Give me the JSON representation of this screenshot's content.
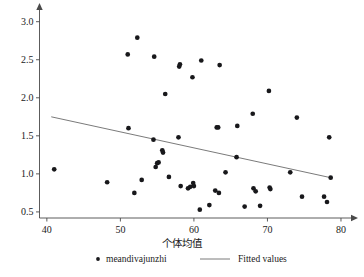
{
  "chart_data": {
    "type": "scatter",
    "title": "",
    "xlabel": "个体均值",
    "ylabel": "",
    "xlim": [
      39.0,
      81.5
    ],
    "ylim": [
      0.42,
      3.18
    ],
    "xticks": [
      40,
      50,
      60,
      70,
      80
    ],
    "xtick_labels": [
      "40",
      "50",
      "60",
      "70",
      "80"
    ],
    "yticks": [
      0.5,
      1.0,
      1.5,
      2.0,
      2.5,
      3.0
    ],
    "ytick_labels": [
      "0.5",
      "1.0",
      "1.5",
      "2.0",
      "2.5",
      "3.0"
    ],
    "grid": false,
    "legend_position": "below",
    "series": [
      {
        "name": "meandivajunzhi",
        "type": "scatter",
        "marker": "circle",
        "color": "#18181b",
        "points": [
          [
            41.0,
            1.06
          ],
          [
            48.2,
            0.89
          ],
          [
            51.0,
            2.57
          ],
          [
            51.1,
            1.6
          ],
          [
            51.9,
            0.75
          ],
          [
            52.3,
            2.79
          ],
          [
            52.9,
            0.92
          ],
          [
            54.6,
            2.54
          ],
          [
            54.5,
            1.45
          ],
          [
            54.8,
            1.09
          ],
          [
            55.0,
            1.14
          ],
          [
            55.2,
            1.15
          ],
          [
            55.7,
            1.31
          ],
          [
            55.8,
            1.28
          ],
          [
            56.1,
            2.05
          ],
          [
            56.6,
            0.96
          ],
          [
            57.9,
            1.48
          ],
          [
            58.0,
            2.41
          ],
          [
            58.1,
            2.44
          ],
          [
            58.2,
            0.84
          ],
          [
            59.2,
            0.81
          ],
          [
            59.5,
            0.83
          ],
          [
            59.8,
            2.27
          ],
          [
            59.9,
            0.88
          ],
          [
            60.0,
            0.84
          ],
          [
            60.8,
            0.53
          ],
          [
            61.0,
            2.49
          ],
          [
            62.1,
            0.59
          ],
          [
            62.9,
            0.78
          ],
          [
            63.1,
            1.61
          ],
          [
            63.3,
            1.61
          ],
          [
            63.4,
            0.75
          ],
          [
            63.5,
            2.43
          ],
          [
            64.3,
            1.02
          ],
          [
            65.8,
            1.22
          ],
          [
            65.9,
            1.63
          ],
          [
            66.9,
            0.57
          ],
          [
            68.0,
            1.79
          ],
          [
            68.1,
            0.81
          ],
          [
            68.4,
            0.77
          ],
          [
            69.0,
            0.58
          ],
          [
            70.2,
            2.09
          ],
          [
            70.3,
            0.82
          ],
          [
            70.4,
            0.8
          ],
          [
            73.1,
            1.02
          ],
          [
            74.0,
            1.74
          ],
          [
            74.7,
            0.7
          ],
          [
            77.7,
            0.7
          ],
          [
            78.1,
            0.63
          ],
          [
            78.4,
            1.48
          ],
          [
            78.6,
            0.95
          ]
        ]
      }
    ],
    "fit_line": {
      "name": "Fitted values",
      "type": "line",
      "color": "#6b6b6b",
      "x": [
        40.6,
        78.6
      ],
      "y": [
        1.75,
        0.95
      ]
    }
  },
  "legend": {
    "items": [
      {
        "label": "meandivajunzhi",
        "marker": "circle",
        "color": "#18181b"
      },
      {
        "label": "Fitted values",
        "marker": "line",
        "color": "#6b6b6b"
      }
    ]
  }
}
